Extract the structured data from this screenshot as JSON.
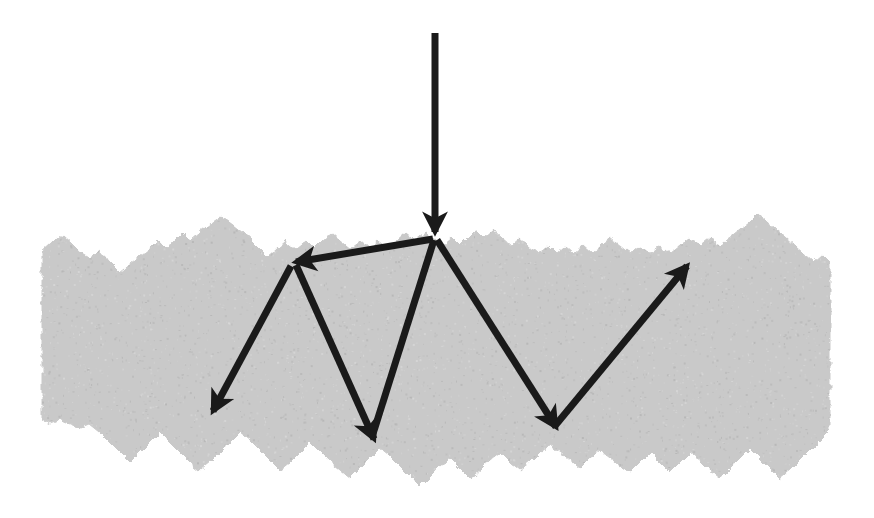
{
  "figure": {
    "background_color": "#ffffff",
    "width": 874,
    "height": 518
  },
  "medium": {
    "name": "rough-granular-surface",
    "fill_color": "#c9c9c9",
    "speckle_color": "#b5b5b5",
    "description": "Irregular jagged grey mass with rough upper and lower boundaries",
    "top_outline": [
      [
        42,
        252
      ],
      [
        52,
        243
      ],
      [
        62,
        235
      ],
      [
        71,
        243
      ],
      [
        80,
        252
      ],
      [
        90,
        258
      ],
      [
        100,
        250
      ],
      [
        110,
        262
      ],
      [
        120,
        272
      ],
      [
        130,
        264
      ],
      [
        140,
        256
      ],
      [
        150,
        248
      ],
      [
        158,
        240
      ],
      [
        166,
        248
      ],
      [
        175,
        241
      ],
      [
        183,
        233
      ],
      [
        191,
        241
      ],
      [
        200,
        233
      ],
      [
        210,
        225
      ],
      [
        222,
        217
      ],
      [
        233,
        225
      ],
      [
        243,
        233
      ],
      [
        252,
        241
      ],
      [
        260,
        249
      ],
      [
        268,
        257
      ],
      [
        277,
        249
      ],
      [
        286,
        241
      ],
      [
        296,
        249
      ],
      [
        306,
        241
      ],
      [
        314,
        249
      ],
      [
        322,
        241
      ],
      [
        331,
        233
      ],
      [
        340,
        241
      ],
      [
        350,
        249
      ],
      [
        360,
        241
      ],
      [
        369,
        249
      ],
      [
        378,
        241
      ],
      [
        388,
        249
      ],
      [
        397,
        241
      ],
      [
        406,
        233
      ],
      [
        416,
        241
      ],
      [
        426,
        233
      ],
      [
        434,
        238
      ],
      [
        443,
        246
      ],
      [
        452,
        238
      ],
      [
        460,
        246
      ],
      [
        468,
        238
      ],
      [
        476,
        230
      ],
      [
        484,
        238
      ],
      [
        493,
        230
      ],
      [
        502,
        238
      ],
      [
        511,
        246
      ],
      [
        520,
        238
      ],
      [
        529,
        246
      ],
      [
        538,
        254
      ],
      [
        548,
        246
      ],
      [
        556,
        254
      ],
      [
        565,
        246
      ],
      [
        574,
        254
      ],
      [
        583,
        246
      ],
      [
        592,
        254
      ],
      [
        601,
        246
      ],
      [
        610,
        238
      ],
      [
        620,
        246
      ],
      [
        630,
        254
      ],
      [
        640,
        246
      ],
      [
        650,
        254
      ],
      [
        660,
        246
      ],
      [
        670,
        254
      ],
      [
        680,
        246
      ],
      [
        690,
        238
      ],
      [
        700,
        246
      ],
      [
        710,
        238
      ],
      [
        720,
        246
      ],
      [
        730,
        238
      ],
      [
        740,
        230
      ],
      [
        750,
        222
      ],
      [
        758,
        214
      ],
      [
        767,
        222
      ],
      [
        776,
        230
      ],
      [
        786,
        238
      ],
      [
        795,
        246
      ],
      [
        804,
        254
      ],
      [
        813,
        262
      ],
      [
        822,
        254
      ],
      [
        830,
        262
      ]
    ],
    "bottom_outline": [
      [
        830,
        430
      ],
      [
        820,
        440
      ],
      [
        810,
        450
      ],
      [
        800,
        460
      ],
      [
        790,
        470
      ],
      [
        780,
        478
      ],
      [
        770,
        468
      ],
      [
        760,
        458
      ],
      [
        750,
        448
      ],
      [
        740,
        458
      ],
      [
        730,
        468
      ],
      [
        720,
        478
      ],
      [
        710,
        470
      ],
      [
        700,
        460
      ],
      [
        690,
        452
      ],
      [
        680,
        462
      ],
      [
        670,
        472
      ],
      [
        660,
        462
      ],
      [
        650,
        452
      ],
      [
        640,
        462
      ],
      [
        630,
        472
      ],
      [
        620,
        466
      ],
      [
        610,
        458
      ],
      [
        600,
        450
      ],
      [
        590,
        458
      ],
      [
        580,
        468
      ],
      [
        570,
        460
      ],
      [
        560,
        452
      ],
      [
        550,
        444
      ],
      [
        540,
        452
      ],
      [
        530,
        462
      ],
      [
        520,
        470
      ],
      [
        510,
        462
      ],
      [
        500,
        452
      ],
      [
        490,
        460
      ],
      [
        480,
        470
      ],
      [
        470,
        478
      ],
      [
        460,
        468
      ],
      [
        450,
        458
      ],
      [
        440,
        466
      ],
      [
        430,
        476
      ],
      [
        420,
        486
      ],
      [
        410,
        476
      ],
      [
        400,
        466
      ],
      [
        390,
        456
      ],
      [
        380,
        448
      ],
      [
        370,
        458
      ],
      [
        360,
        468
      ],
      [
        350,
        478
      ],
      [
        340,
        470
      ],
      [
        330,
        462
      ],
      [
        320,
        452
      ],
      [
        310,
        442
      ],
      [
        300,
        452
      ],
      [
        290,
        462
      ],
      [
        280,
        470
      ],
      [
        270,
        460
      ],
      [
        260,
        450
      ],
      [
        250,
        440
      ],
      [
        240,
        432
      ],
      [
        230,
        442
      ],
      [
        220,
        452
      ],
      [
        210,
        462
      ],
      [
        200,
        470
      ],
      [
        190,
        462
      ],
      [
        180,
        452
      ],
      [
        170,
        442
      ],
      [
        160,
        432
      ],
      [
        150,
        442
      ],
      [
        140,
        452
      ],
      [
        130,
        462
      ],
      [
        120,
        452
      ],
      [
        110,
        442
      ],
      [
        100,
        432
      ],
      [
        90,
        424
      ],
      [
        80,
        428
      ],
      [
        70,
        424
      ],
      [
        60,
        420
      ],
      [
        50,
        424
      ],
      [
        42,
        420
      ]
    ]
  },
  "rays": {
    "stroke_color": "#1a1a1a",
    "stroke_width": 7,
    "items": [
      {
        "name": "incident-ray",
        "label": "Incident ray",
        "path": [
          [
            435,
            33
          ],
          [
            435,
            232
          ]
        ],
        "arrowheads": [
          "end"
        ],
        "direction": "downward"
      },
      {
        "name": "scattered-ray-left-upward",
        "label": "First scattered ray travelling up-left",
        "path": [
          [
            433,
            239
          ],
          [
            296,
            262
          ]
        ],
        "arrowheads": [
          "end"
        ],
        "direction": "up-left"
      },
      {
        "name": "scattered-ray-left-downward",
        "label": "Scattered ray travelling down-left out of the medium",
        "path": [
          [
            291,
            266
          ],
          [
            213,
            411
          ]
        ],
        "arrowheads": [
          "end"
        ],
        "direction": "down-left"
      },
      {
        "name": "scattered-ray-mid-downward",
        "label": "Scattered ray travelling down-right to lower boundary",
        "path": [
          [
            296,
            265
          ],
          [
            374,
            439
          ]
        ],
        "arrowheads": [
          "end"
        ],
        "direction": "down-right"
      },
      {
        "name": "scattered-ray-center-upward",
        "label": "Scattered ray returning up toward the reflection point",
        "path": [
          [
            372,
            437
          ],
          [
            434,
            240
          ]
        ],
        "arrowheads": [],
        "direction": "up-right"
      },
      {
        "name": "scattered-ray-right-downward",
        "label": "Scattered ray travelling down-right",
        "path": [
          [
            437,
            240
          ],
          [
            556,
            427
          ]
        ],
        "arrowheads": [
          "end"
        ],
        "direction": "down-right"
      },
      {
        "name": "scattered-ray-right-upward",
        "label": "Emergent ray travelling up-right out of the medium",
        "path": [
          [
            554,
            427
          ],
          [
            687,
            266
          ]
        ],
        "arrowheads": [
          "end"
        ],
        "direction": "up-right"
      }
    ]
  },
  "annotations": {
    "items": []
  },
  "chart_data": {
    "type": "diagram",
    "xlabel": "",
    "ylabel": "",
    "legend": [],
    "grid": false,
    "elements": [
      {
        "kind": "surface",
        "name": "rough-granular-surface",
        "color": "#c9c9c9",
        "x_extent": [
          42,
          830
        ],
        "y_extent": [
          214,
          486
        ]
      },
      {
        "kind": "vector",
        "name": "incident-ray",
        "from": [
          435,
          33
        ],
        "to": [
          435,
          232
        ],
        "color": "#1a1a1a"
      },
      {
        "kind": "vector",
        "name": "scattered-ray-left-upward",
        "from": [
          433,
          239
        ],
        "to": [
          296,
          262
        ],
        "color": "#1a1a1a"
      },
      {
        "kind": "vector",
        "name": "scattered-ray-left-downward",
        "from": [
          291,
          266
        ],
        "to": [
          213,
          411
        ],
        "color": "#1a1a1a"
      },
      {
        "kind": "vector",
        "name": "scattered-ray-mid-downward",
        "from": [
          296,
          265
        ],
        "to": [
          374,
          439
        ],
        "color": "#1a1a1a"
      },
      {
        "kind": "vector",
        "name": "scattered-ray-center-upward",
        "from": [
          372,
          437
        ],
        "to": [
          434,
          240
        ],
        "color": "#1a1a1a"
      },
      {
        "kind": "vector",
        "name": "scattered-ray-right-downward",
        "from": [
          437,
          240
        ],
        "to": [
          556,
          427
        ],
        "color": "#1a1a1a"
      },
      {
        "kind": "vector",
        "name": "scattered-ray-right-upward",
        "from": [
          554,
          427
        ],
        "to": [
          687,
          266
        ],
        "color": "#1a1a1a"
      }
    ]
  }
}
